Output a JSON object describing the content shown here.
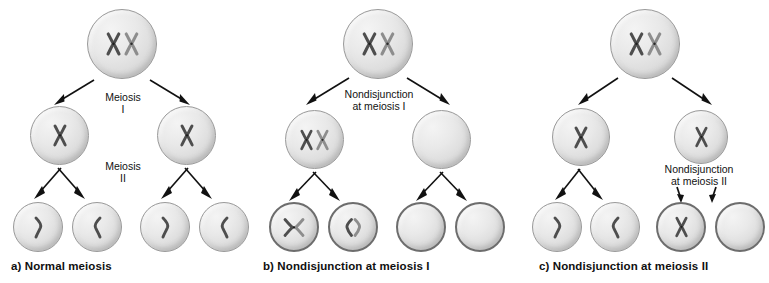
{
  "figure": {
    "background_color": "#ffffff",
    "chromosome_color_dark": "#4a4a4a",
    "chromosome_color_light": "#8a8a8a",
    "cell_fill_color": "#e4e4e4",
    "cell_outline_color": "#8e8e8e",
    "arrow_color": "#111111"
  },
  "panels": [
    {
      "id": "a",
      "caption": "a) Normal meiosis",
      "labels": [
        {
          "name": "meiosis-i-label",
          "line1": "Meiosis",
          "line2": "I"
        },
        {
          "name": "meiosis-ii-label",
          "line1": "Meiosis",
          "line2": "II"
        }
      ],
      "rows": {
        "parent": [
          {
            "contents": "two-chromosomes",
            "count": 2
          }
        ],
        "intermediate": [
          {
            "contents": "one-chromosome",
            "count": 1
          },
          {
            "contents": "one-chromosome",
            "count": 1
          }
        ],
        "gametes": [
          {
            "contents": "one-chromatid-right",
            "count": 1
          },
          {
            "contents": "one-chromatid-left",
            "count": 1
          },
          {
            "contents": "one-chromatid-right",
            "count": 1
          },
          {
            "contents": "one-chromatid-left",
            "count": 1
          }
        ]
      }
    },
    {
      "id": "b",
      "caption": "b) Nondisjunction at meiosis I",
      "labels": [
        {
          "name": "nondisjunction-meiosis-i-label",
          "line1": "Nondisjunction",
          "line2": "at meiosis I"
        }
      ],
      "rows": {
        "parent": [
          {
            "contents": "two-chromosomes",
            "count": 2
          }
        ],
        "intermediate": [
          {
            "contents": "two-chromosomes",
            "count": 2
          },
          {
            "contents": "empty",
            "count": 0
          }
        ],
        "gametes": [
          {
            "contents": "two-chromatids-crossed",
            "count": 2
          },
          {
            "contents": "two-chromatids-split",
            "count": 2
          },
          {
            "contents": "empty",
            "count": 0
          },
          {
            "contents": "empty",
            "count": 0
          }
        ]
      }
    },
    {
      "id": "c",
      "caption": "c) Nondisjunction at meiosis II",
      "labels": [
        {
          "name": "nondisjunction-meiosis-ii-label",
          "line1": "Nondisjunction",
          "line2": "at meiosis II"
        }
      ],
      "rows": {
        "parent": [
          {
            "contents": "two-chromosomes",
            "count": 2
          }
        ],
        "intermediate": [
          {
            "contents": "one-chromosome",
            "count": 1
          },
          {
            "contents": "one-chromosome",
            "count": 1
          }
        ],
        "gametes": [
          {
            "contents": "one-chromatid-right",
            "count": 1
          },
          {
            "contents": "one-chromatid-left",
            "count": 1
          },
          {
            "contents": "one-chromosome",
            "count": 1
          },
          {
            "contents": "empty",
            "count": 0
          }
        ]
      }
    }
  ]
}
